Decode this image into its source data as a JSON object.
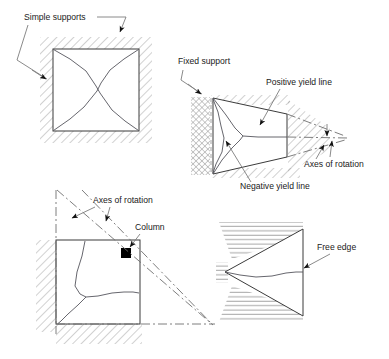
{
  "figure": {
    "type": "engineering-diagram",
    "background_color": "#ffffff",
    "line_color": "#3b3b3b",
    "hatch_color": "#9a9a9a",
    "text_color": "#1a1a1a",
    "column_fill": "#000000"
  },
  "labels": {
    "simple_supports": "Simple supports",
    "fixed_support": "Fixed support",
    "positive_yield_line": "Positive yield line",
    "negative_yield_line": "Negative yield line",
    "axes_of_rotation_right": "Axes of rotation",
    "axes_of_rotation_left": "Axes of rotation",
    "column": "Column",
    "free_edge": "Free edge"
  },
  "panels": [
    {
      "id": "panel-simply-supported-square",
      "shape": "square",
      "support": "simple supports on all four edges",
      "hatching": "diagonal",
      "yield_pattern": "X-shaped diagonals from the four corners",
      "labels": [
        "Simple supports"
      ]
    },
    {
      "id": "panel-fixed-support-trapezoid",
      "shape": "trapezoid",
      "support": "fixed support on left edge",
      "hatching": "cross-hatch at fixed edge, diagonal elsewhere",
      "yield_pattern": "positive and negative yield lines converging to a fan",
      "labels": [
        "Fixed support",
        "Positive yield line",
        "Negative yield line",
        "Axes of rotation"
      ]
    },
    {
      "id": "panel-column-supported-square",
      "shape": "square",
      "support": "simple supports on left and bottom edges with a corner column",
      "hatching": "diagonal",
      "yield_pattern": "Y-shaped fan radiating from the column",
      "labels": [
        "Axes of rotation",
        "Column"
      ]
    },
    {
      "id": "panel-free-edge-triangle",
      "shape": "triangle",
      "support": "supported on the two slanted edges",
      "hatching": "horizontal",
      "yield_pattern": "single yield line to the apex",
      "labels": [
        "Free edge"
      ]
    }
  ]
}
